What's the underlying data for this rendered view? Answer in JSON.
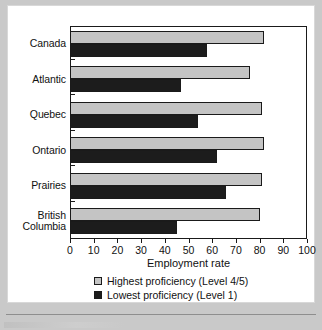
{
  "chart_data": {
    "type": "bar",
    "orientation": "horizontal",
    "title": "",
    "xlabel": "Employment rate",
    "ylabel": "",
    "xlim": [
      0,
      100
    ],
    "xticks": [
      0,
      10,
      20,
      30,
      40,
      50,
      60,
      70,
      80,
      90,
      100
    ],
    "xtick_labels": [
      "0",
      "10",
      "20",
      "30",
      "40",
      "50",
      "60",
      "70",
      "80",
      "90",
      "100"
    ],
    "grid": false,
    "legend_position": "bottom",
    "categories": [
      "Canada",
      "Atlantic",
      "Quebec",
      "Ontario",
      "Prairies",
      "British Columbia"
    ],
    "category_display": [
      [
        "Canada"
      ],
      [
        "Atlantic"
      ],
      [
        "Quebec"
      ],
      [
        "Ontario"
      ],
      [
        "Prairies"
      ],
      [
        "British",
        "Columbia"
      ]
    ],
    "series": [
      {
        "name": "Highest proficiency (Level 4/5)",
        "color": "#c4c4c4",
        "values": [
          82,
          76,
          81,
          82,
          81,
          80
        ]
      },
      {
        "name": "Lowest proficiency (Level 1)",
        "color": "#1c1c1c",
        "values": [
          58,
          47,
          54,
          62,
          66,
          45
        ]
      }
    ]
  },
  "legend": {
    "items": [
      {
        "label": "Highest proficiency (Level 4/5)",
        "swatch": "light-gray-square-swatch"
      },
      {
        "label": "Lowest proficiency (Level 1)",
        "swatch": "black-square-swatch"
      }
    ]
  },
  "colors": {
    "page_background": "#c9c9c9",
    "card_background": "#ffffff",
    "axis": "#1a1a1a",
    "series_high": "#c4c4c4",
    "series_low": "#1c1c1c",
    "text": "#111111"
  }
}
